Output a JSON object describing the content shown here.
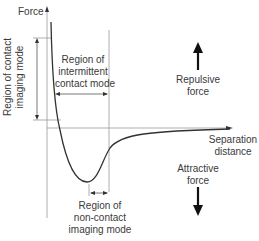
{
  "diagram": {
    "y_axis_label": "Force",
    "x_axis_label_line1": "Separation",
    "x_axis_label_line2": "distance",
    "contact_region_line1": "Region of contact",
    "contact_region_line2": "imaging mode",
    "intermittent_region_line1": "Region of",
    "intermittent_region_line2": "intermittent",
    "intermittent_region_line3": "contact mode",
    "noncontact_region_line1": "Region of",
    "noncontact_region_line2": "non-contact",
    "noncontact_region_line3": "imaging mode",
    "repulsive_line1": "Repulsive",
    "repulsive_line2": "force",
    "attractive_line1": "Attractive",
    "attractive_line2": "force",
    "repulsive_arrow_icon": "up-arrow-icon",
    "attractive_arrow_icon": "down-arrow-icon",
    "colors": {
      "curve": "#333333",
      "guide_lines": "#9a9a9a",
      "text": "#3a3a3a",
      "arrows": "#111111"
    }
  }
}
